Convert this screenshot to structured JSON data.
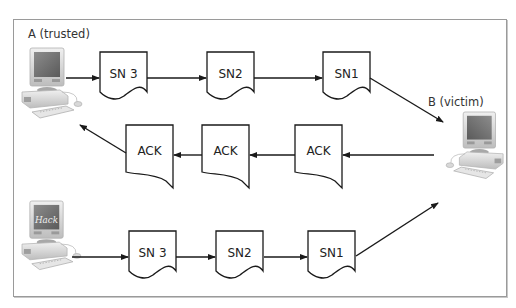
{
  "diagram": {
    "type": "tcp-session-hijack-sequence",
    "nodes": {
      "host_a": {
        "label": "A (trusted)",
        "icon": "desktop-computer-icon"
      },
      "host_b": {
        "label": "B (victim)",
        "icon": "desktop-computer-icon"
      },
      "attacker": {
        "label": "",
        "screen_text": "Hack",
        "icon": "desktop-computer-hack-icon"
      }
    },
    "rows": {
      "trusted_to_victim": [
        "SN 3",
        "SN2",
        "SN1"
      ],
      "victim_to_trusted": [
        "ACK",
        "ACK",
        "ACK"
      ],
      "attacker_to_victim": [
        "SN 3",
        "SN2",
        "SN1"
      ]
    },
    "colors": {
      "stroke": "#1a1a1a",
      "frame": "#9a9a9a",
      "background": "#ffffff"
    }
  }
}
